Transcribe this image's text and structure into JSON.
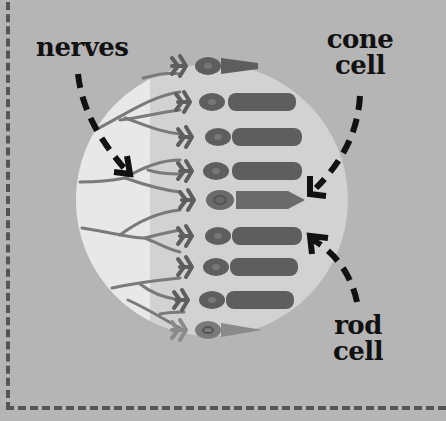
{
  "diagram": {
    "colors": {
      "background": "#b5b5b5",
      "circle_outer": "#d2d2d2",
      "circle_inner": "#e8e8e8",
      "cell_body": "#5e5e5e",
      "cone_highlight": "#6a6a6a",
      "nerve": "#7a7a7a",
      "text": "#111111",
      "border": "#555555"
    },
    "labels": {
      "nerves": "nerves",
      "cone_line1": "cone",
      "cone_line2": "cell",
      "rod_line1": "rod",
      "rod_line2": "cell"
    },
    "cells": [
      {
        "type": "cone",
        "y": 66
      },
      {
        "type": "rod",
        "y": 102
      },
      {
        "type": "rod",
        "y": 137
      },
      {
        "type": "rod",
        "y": 171
      },
      {
        "type": "cone",
        "y": 200
      },
      {
        "type": "rod",
        "y": 236
      },
      {
        "type": "rod",
        "y": 267
      },
      {
        "type": "rod",
        "y": 300
      },
      {
        "type": "cone",
        "y": 330
      }
    ],
    "arrows": [
      {
        "from": "nerves",
        "to": "nerve-branches"
      },
      {
        "from": "cone cell",
        "to": "cone-cell-5"
      },
      {
        "from": "rod cell",
        "to": "rod-cell-6"
      }
    ]
  }
}
